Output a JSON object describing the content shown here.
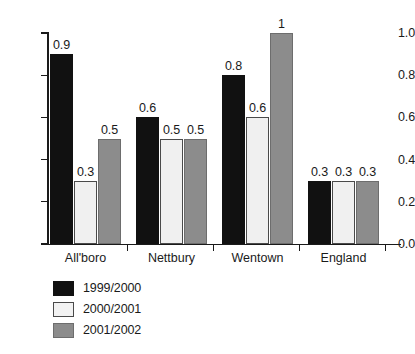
{
  "chart_data": {
    "type": "bar",
    "title": "",
    "subtitle": "",
    "xlabel": "",
    "ylabel": "",
    "ylim": [
      0.0,
      1.0
    ],
    "y_ticks": [
      "0.0",
      "0.2",
      "0.4",
      "0.6",
      "0.8",
      "1.0"
    ],
    "y_tick_values": [
      0.0,
      0.2,
      0.4,
      0.6,
      0.8,
      1.0
    ],
    "grid": false,
    "legend_position": "bottom-left",
    "categories": [
      "All'boro",
      "Nettbury",
      "Wentown",
      "England"
    ],
    "series": [
      {
        "name": "1999/2000",
        "color": "#111111",
        "values": [
          0.9,
          0.6,
          0.8,
          0.3
        ],
        "labels": [
          "0.9",
          "0.6",
          "0.8",
          "0.3"
        ]
      },
      {
        "name": "2000/2001",
        "color": "#f0f0f0",
        "values": [
          0.3,
          0.5,
          0.6,
          0.3
        ],
        "labels": [
          "0.3",
          "0.5",
          "0.6",
          "0.3"
        ]
      },
      {
        "name": "2001/2002",
        "color": "#8c8c8c",
        "values": [
          0.5,
          0.5,
          1.0,
          0.3
        ],
        "labels": [
          "0.5",
          "0.5",
          "1",
          "0.3"
        ]
      }
    ]
  }
}
